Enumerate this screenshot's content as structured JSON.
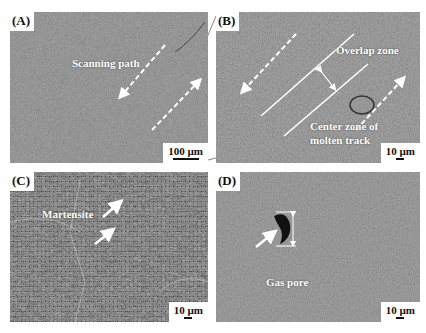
{
  "figure": {
    "panels": [
      {
        "id": "A",
        "label": "(A)",
        "scale_bar": "100 µm",
        "annotations": [
          "Scanning path"
        ],
        "texture": "fine"
      },
      {
        "id": "B",
        "label": "(B)",
        "scale_bar": "10 µm",
        "annotations": [
          "Overlap zone",
          "Center zone of",
          "molten track"
        ],
        "texture": "medium"
      },
      {
        "id": "C",
        "label": "(C)",
        "scale_bar": "10 µm",
        "annotations": [
          "Martensite"
        ],
        "texture": "coarse"
      },
      {
        "id": "D",
        "label": "(D)",
        "scale_bar": "10 µm",
        "annotations": [
          "Gas pore"
        ],
        "texture": "medium"
      }
    ],
    "colors": {
      "background": "#ffffff",
      "micrograph": "#7a7a7a",
      "annotation": "#ffffff",
      "pore": "#111111"
    }
  }
}
